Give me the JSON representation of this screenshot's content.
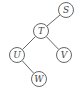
{
  "diagram": {
    "type": "tree",
    "nodes": [
      {
        "id": "S",
        "label": "S",
        "x": 66,
        "y": 10
      },
      {
        "id": "T",
        "label": "T",
        "x": 41,
        "y": 31
      },
      {
        "id": "U",
        "label": "U",
        "x": 17,
        "y": 55
      },
      {
        "id": "V",
        "label": "V",
        "x": 64,
        "y": 55
      },
      {
        "id": "W",
        "label": "W",
        "x": 39,
        "y": 79
      }
    ],
    "edges": [
      {
        "from": "S",
        "to": "T"
      },
      {
        "from": "T",
        "to": "U"
      },
      {
        "from": "T",
        "to": "V"
      },
      {
        "from": "U",
        "to": "W"
      }
    ],
    "node_radius": 7.5,
    "colors": {
      "stroke": "#555555",
      "text": "#444444",
      "background": "#ffffff"
    }
  }
}
